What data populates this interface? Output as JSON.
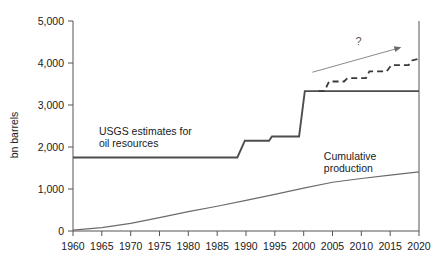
{
  "chart_data": {
    "type": "line",
    "title": "",
    "subtitle": "",
    "xlabel": "",
    "ylabel": "bn barrels",
    "xlim": [
      1960,
      2020
    ],
    "ylim": [
      0,
      5000
    ],
    "grid": false,
    "legend_position": "inline-annotations",
    "x_ticks": [
      "1960",
      "1965",
      "1970",
      "1975",
      "1980",
      "1985",
      "1990",
      "1995",
      "2000",
      "2005",
      "2010",
      "2015",
      "2020"
    ],
    "x_tick_values": [
      1960,
      1965,
      1970,
      1975,
      1980,
      1985,
      1990,
      1995,
      2000,
      2005,
      2010,
      2015,
      2020
    ],
    "y_ticks": [
      "0",
      "1,000",
      "2,000",
      "3,000",
      "4,000",
      "5,000"
    ],
    "y_tick_values": [
      0,
      1000,
      2000,
      3000,
      4000,
      5000
    ],
    "series": [
      {
        "name": "USGS estimates for oil resources",
        "style": "solid",
        "color": "#4d4d4d",
        "step": true,
        "x": [
          1960,
          1988.5,
          1989.8,
          1994.0,
          1994.5,
          1999.2,
          2000.2,
          2020
        ],
        "values": [
          1750,
          1750,
          2150,
          2150,
          2250,
          2250,
          3330,
          3330
        ]
      },
      {
        "name": "Cumulative production",
        "style": "solid-thin",
        "color": "#6b6b6b",
        "step": false,
        "x": [
          1960,
          1965,
          1970,
          1975,
          1980,
          1985,
          1990,
          1995,
          2000,
          2005,
          2010,
          2015,
          2020
        ],
        "values": [
          20,
          80,
          180,
          320,
          460,
          590,
          730,
          870,
          1020,
          1160,
          1250,
          1330,
          1410
        ]
      },
      {
        "name": "Projection (unlabelled dashed)",
        "style": "dashed",
        "color": "#3a3a3a",
        "step": true,
        "x": [
          2002.6,
          2003.6,
          2004.4,
          2007.0,
          2007.6,
          2010.8,
          2011.4,
          2014.4,
          2015.2,
          2018.2,
          2018.8,
          2020
        ],
        "values": [
          3330,
          3330,
          3560,
          3560,
          3640,
          3640,
          3800,
          3800,
          3950,
          3950,
          4060,
          4100
        ]
      }
    ],
    "annotations": [
      {
        "name": "usgs-estimates-label",
        "text_line1": "USGS estimates for",
        "text_line2": "oil resources",
        "x": 1964.5,
        "y": 2280
      },
      {
        "name": "cumulative-production-label",
        "text_line1": "Cumulative",
        "text_line2": "production",
        "x": 2003.5,
        "y": 1700
      },
      {
        "name": "question-mark-annotation",
        "text": "?",
        "x": 2009.5,
        "y": 4430
      },
      {
        "name": "trend-arrow",
        "x_start": 2001.5,
        "y_start": 3780,
        "x_end": 2016.6,
        "y_end": 4360
      }
    ]
  },
  "colors": {
    "background": "#ffffff",
    "axis": "#555555",
    "usgs_line": "#4d4d4d",
    "cumulative_line": "#6b6b6b",
    "dashed_line": "#3a3a3a",
    "arrow": "#8a8a8a",
    "text": "#1a1a1a"
  }
}
